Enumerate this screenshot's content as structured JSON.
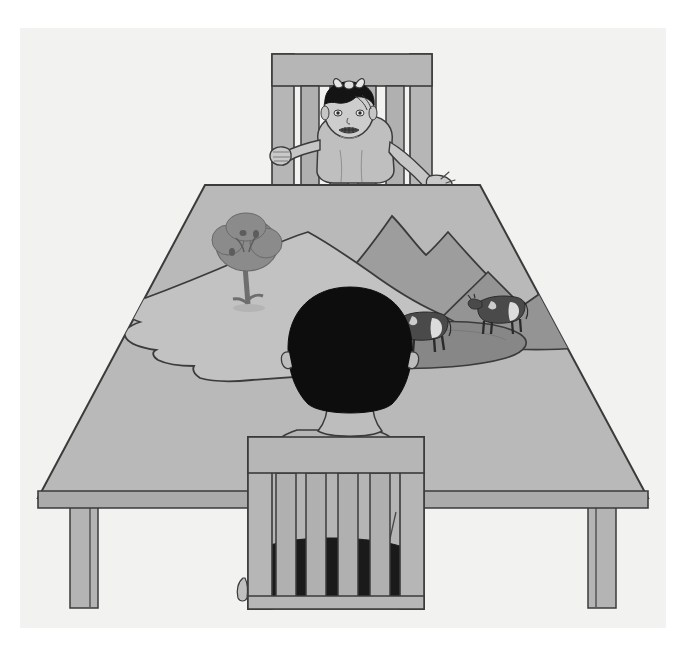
{
  "image": {
    "title": "Three mountains task illustration",
    "description": "Grayscale line drawing: a boy seen from behind sits at a table looking at a model landscape with mountains, a tree, a road and two cows; a baby in a high chair sits on the far side of the table.",
    "medium": "black-and-white line illustration",
    "width": 686,
    "height": 646
  },
  "palette": {
    "page_white": "#ffffff",
    "panel": "#f2f2f0",
    "outline": "#3b3b3b",
    "table_top": "#b9b9b9",
    "table_edge": "#a8a8a8",
    "table_leg": "#b4b4b4",
    "chair_wood": "#b6b6b6",
    "chair_wood_dark": "#a5a5a5",
    "plateau_light": "#c2c2c2",
    "mountain_mid": "#9d9d9d",
    "mountain_back": "#8f8f8f",
    "road_gray": "#878787",
    "tree_foliage": "#8b8b8b",
    "tree_trunk": "#6e6e6e",
    "skin": "#c9c9c9",
    "shirt": "#b5b5b5",
    "hair_black": "#0d0d0d",
    "shorts_black": "#1a1a1a",
    "cow_body": "#4a4a4a",
    "cow_patch": "#dcdcdc"
  },
  "objects": {
    "panel": {
      "name": "page-panel"
    },
    "table": {
      "name": "table",
      "top_label": "table top (trapezoid, perspective view)",
      "edge_label": "table front edge band",
      "legs": [
        {
          "label": "front-left table leg"
        },
        {
          "label": "front-right table leg"
        }
      ]
    },
    "far_chair": {
      "name": "high-chair",
      "label": "far chair with slatted back",
      "slat_count": 4
    },
    "near_chair": {
      "name": "near-chair",
      "label": "near chair with slatted back seen from behind",
      "slat_count": 4
    },
    "baby": {
      "name": "baby",
      "label": "baby seated in far chair, arms on table, hair bow",
      "features": [
        "hair-bow",
        "left-hand-fist",
        "right-hand-open"
      ]
    },
    "boy": {
      "name": "boy",
      "label": "boy seen from behind, dark hair, light shirt, dark shorts"
    },
    "model_landscape": {
      "name": "model-landscape",
      "label": "papier-mache model of hills and mountains on the table",
      "elements": [
        {
          "label": "light plateau / foreground hill"
        },
        {
          "label": "tall back mountain"
        },
        {
          "label": "second mountain ridge, right"
        },
        {
          "label": "winding road"
        },
        {
          "label": "tree on the left hill"
        },
        {
          "label": "cow, nearer (left)"
        },
        {
          "label": "cow, farther (right)"
        }
      ],
      "tree_count": 1,
      "cow_count": 2,
      "mountain_count": 3
    }
  }
}
